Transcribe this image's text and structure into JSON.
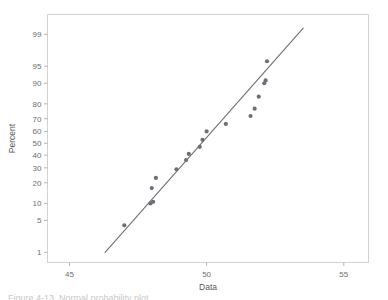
{
  "figure": {
    "background_color": "#ffffff",
    "frame_color": "#d2d2d2",
    "marker_color": "#6b6f7a",
    "line_color": "#707070",
    "tick_color": "#b5b5b5",
    "text_color": "#6e6e6e",
    "caption_partial": "Figure 4-13.  Normal probability plot"
  },
  "chart_data": {
    "type": "scatter",
    "title": "",
    "subtitle": "",
    "xlabel": "Data",
    "ylabel": "Percent",
    "plot_kind": "normal-probability-plot",
    "grid": false,
    "legend": false,
    "xlim": [
      44.2,
      55.9
    ],
    "xticks": [
      45,
      50,
      55
    ],
    "xtick_labels": [
      "45",
      "50",
      "55"
    ],
    "yscale": "probit",
    "ylim_percent": [
      0.55,
      99.7
    ],
    "yticks": [
      1,
      5,
      10,
      20,
      30,
      40,
      50,
      60,
      70,
      80,
      90,
      95,
      99
    ],
    "ytick_labels": [
      "1",
      "5",
      "10",
      "20",
      "30",
      "40",
      "50",
      "60",
      "70",
      "80",
      "90",
      "95",
      "99"
    ],
    "points": [
      {
        "x": 47.0,
        "percent": 4.0
      },
      {
        "x": 47.95,
        "percent": 10.0
      },
      {
        "x": 48.05,
        "percent": 10.6
      },
      {
        "x": 48.0,
        "percent": 17.0
      },
      {
        "x": 48.15,
        "percent": 23.0
      },
      {
        "x": 48.9,
        "percent": 29.0
      },
      {
        "x": 49.25,
        "percent": 36.0
      },
      {
        "x": 49.35,
        "percent": 41.0
      },
      {
        "x": 49.75,
        "percent": 47.0
      },
      {
        "x": 49.85,
        "percent": 53.0
      },
      {
        "x": 50.0,
        "percent": 60.0
      },
      {
        "x": 50.7,
        "percent": 66.0
      },
      {
        "x": 51.6,
        "percent": 72.0
      },
      {
        "x": 51.75,
        "percent": 77.0
      },
      {
        "x": 51.9,
        "percent": 84.0
      },
      {
        "x": 52.1,
        "percent": 90.0
      },
      {
        "x": 52.15,
        "percent": 91.0
      },
      {
        "x": 52.2,
        "percent": 96.0
      }
    ],
    "fit_line": {
      "x_start": 46.3,
      "percent_start": 1.0,
      "x_end": 53.52,
      "percent_end": 99.3
    }
  }
}
